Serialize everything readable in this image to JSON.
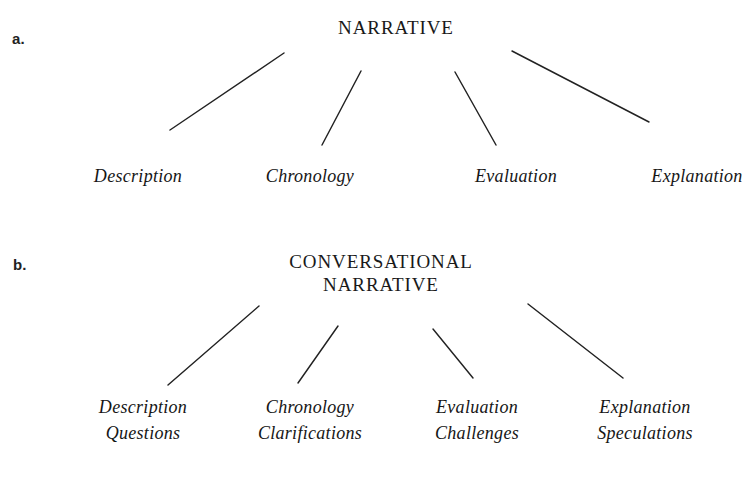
{
  "figure": {
    "background_color": "#ffffff",
    "ink_color": "#1a1a1a",
    "width": 756,
    "height": 479
  },
  "panels": [
    {
      "id": "a",
      "label": "a.",
      "label_x": 12,
      "label_y": 30,
      "root": {
        "lines": [
          "NARRATIVE"
        ],
        "x": 396,
        "y": 16
      },
      "leaves": [
        {
          "lines": [
            "Description"
          ],
          "x": 138,
          "y": 163
        },
        {
          "lines": [
            "Chronology"
          ],
          "x": 310,
          "y": 163
        },
        {
          "lines": [
            "Evaluation"
          ],
          "x": 516,
          "y": 163
        },
        {
          "lines": [
            "Explanation"
          ],
          "x": 697,
          "y": 163
        }
      ],
      "edges": [
        {
          "x1": 170,
          "y1": 130,
          "x2": 284,
          "y2": 53
        },
        {
          "x1": 322,
          "y1": 145,
          "x2": 361,
          "y2": 71
        },
        {
          "x1": 455,
          "y1": 72,
          "x2": 496,
          "y2": 145
        },
        {
          "x1": 512,
          "y1": 51,
          "x2": 649,
          "y2": 122
        }
      ]
    },
    {
      "id": "b",
      "label": "b.",
      "label_x": 13,
      "label_y": 256,
      "root": {
        "lines": [
          "CONVERSATIONAL",
          "NARRATIVE"
        ],
        "x": 381,
        "y": 250
      },
      "leaves": [
        {
          "lines": [
            "Description",
            "Questions"
          ],
          "x": 143,
          "y": 394
        },
        {
          "lines": [
            "Chronology",
            "Clarifications"
          ],
          "x": 310,
          "y": 394
        },
        {
          "lines": [
            "Evaluation",
            "Challenges"
          ],
          "x": 477,
          "y": 394
        },
        {
          "lines": [
            "Explanation",
            "Speculations"
          ],
          "x": 645,
          "y": 394
        }
      ],
      "edges": [
        {
          "x1": 168,
          "y1": 385,
          "x2": 259,
          "y2": 306
        },
        {
          "x1": 298,
          "y1": 383,
          "x2": 338,
          "y2": 326
        },
        {
          "x1": 433,
          "y1": 329,
          "x2": 473,
          "y2": 378
        },
        {
          "x1": 528,
          "y1": 304,
          "x2": 623,
          "y2": 378
        }
      ]
    }
  ]
}
